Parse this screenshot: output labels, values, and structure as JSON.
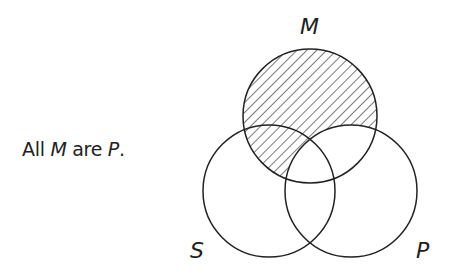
{
  "statement": {
    "prefix": "All ",
    "subject": "M",
    "copula": " are ",
    "predicate": "P",
    "suffix": "."
  },
  "diagram": {
    "type": "venn-3-set",
    "circles": [
      {
        "name": "M",
        "label": "M",
        "cx": 310,
        "cy": 116,
        "r": 67,
        "position": "top"
      },
      {
        "name": "S",
        "label": "S",
        "cx": 269,
        "cy": 191,
        "r": 66,
        "position": "bottom-left"
      },
      {
        "name": "P",
        "label": "P",
        "cx": 351,
        "cy": 191,
        "r": 66,
        "position": "bottom-right"
      }
    ],
    "shaded_region": "M outside P (empty)",
    "hatch_style": "diagonal lines",
    "stroke_color": "#222222",
    "background": "#ffffff"
  }
}
